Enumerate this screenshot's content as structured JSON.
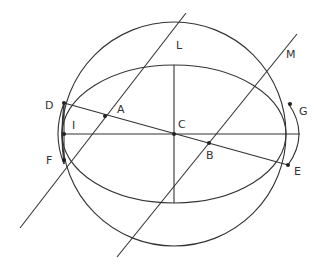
{
  "colors": {
    "line": "#333333",
    "point": "#222222",
    "background": "#ffffff"
  },
  "circle": {
    "cx": 174,
    "cy": 134,
    "r": 112
  },
  "ellipse": {
    "cx": 174,
    "cy": 134,
    "rx": 112,
    "ry": 69
  },
  "axes": {
    "horizontal": {
      "x1": 62,
      "y1": 134,
      "x2": 300,
      "y2": 134
    },
    "vertical": {
      "x1": 174,
      "y1": 65,
      "x2": 174,
      "y2": 203
    }
  },
  "lines": [
    {
      "name": "diameter-DE",
      "x1": 64,
      "y1": 103,
      "x2": 288,
      "y2": 165
    },
    {
      "name": "line-AL",
      "x1": 20,
      "y1": 228,
      "x2": 186,
      "y2": 13
    },
    {
      "name": "line-BM",
      "x1": 117,
      "y1": 257,
      "x2": 297,
      "y2": 34
    },
    {
      "name": "chord-DF",
      "x1": 64,
      "y1": 103,
      "x2": 64,
      "y2": 164
    }
  ],
  "small_arcs": [
    {
      "name": "left-arc-outer",
      "d": "M 64 103 Q 52 134 64 164"
    },
    {
      "name": "left-arc-inner",
      "d": "M 64 103 Q 60 134 64 164"
    },
    {
      "name": "right-arc",
      "d": "M 288 103 Q 310 134 288 165"
    }
  ],
  "points": [
    {
      "label": "D",
      "x": 64,
      "y": 103,
      "lx": 45,
      "ly": 109
    },
    {
      "label": "A",
      "x": 105,
      "y": 116,
      "lx": 117,
      "ly": 113
    },
    {
      "label": "C",
      "x": 174,
      "y": 134,
      "lx": 178,
      "ly": 128
    },
    {
      "label": "B",
      "x": 209,
      "y": 143,
      "lx": 206,
      "ly": 159
    },
    {
      "label": "E",
      "x": 288,
      "y": 165,
      "lx": 294,
      "ly": 175
    },
    {
      "label": "G",
      "x": 290,
      "y": 104,
      "lx": 299,
      "ly": 115
    },
    {
      "label": "I",
      "x": 64,
      "y": 134,
      "lx": 72,
      "ly": 129
    },
    {
      "label": "F",
      "x": 64,
      "y": 160,
      "lx": 46,
      "ly": 164
    },
    {
      "label": "L",
      "x": null,
      "y": null,
      "lx": 176,
      "ly": 49
    },
    {
      "label": "M",
      "x": null,
      "y": null,
      "lx": 286,
      "ly": 58
    }
  ]
}
